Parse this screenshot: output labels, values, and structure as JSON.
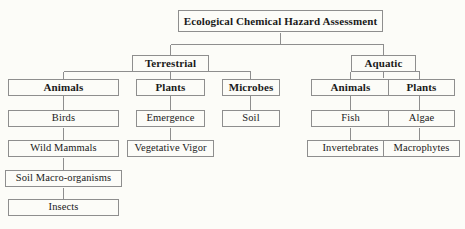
{
  "diagram": {
    "type": "hierarchy-tree",
    "title": "Ecological Chemical Hazard Assessment",
    "root": {
      "id": "root",
      "label": "Ecological Chemical Hazard Assessment",
      "level": 1
    },
    "branches": [
      {
        "id": "terrestrial",
        "label": "Terrestrial",
        "level": 2,
        "categories": [
          {
            "id": "terrestrial-animals",
            "label": "Animals",
            "level": 3,
            "leaves": [
              {
                "id": "birds",
                "label": "Birds"
              },
              {
                "id": "wild-mammals",
                "label": "Wild Mammals"
              },
              {
                "id": "soil-macro-organisms",
                "label": "Soil Macro-organisms"
              },
              {
                "id": "insects",
                "label": "Insects"
              }
            ]
          },
          {
            "id": "terrestrial-plants",
            "label": "Plants",
            "level": 3,
            "leaves": [
              {
                "id": "emergence",
                "label": "Emergence"
              },
              {
                "id": "vegetative-vigor",
                "label": "Vegetative Vigor"
              }
            ]
          },
          {
            "id": "terrestrial-microbes",
            "label": "Microbes",
            "level": 3,
            "leaves": [
              {
                "id": "soil",
                "label": "Soil"
              }
            ]
          }
        ]
      },
      {
        "id": "aquatic",
        "label": "Aquatic",
        "level": 2,
        "categories": [
          {
            "id": "aquatic-animals",
            "label": "Animals",
            "level": 3,
            "leaves": [
              {
                "id": "fish",
                "label": "Fish"
              },
              {
                "id": "invertebrates",
                "label": "Invertebrates"
              }
            ]
          },
          {
            "id": "aquatic-plants",
            "label": "Plants",
            "level": 3,
            "leaves": [
              {
                "id": "algae",
                "label": "Algae"
              },
              {
                "id": "macrophytes",
                "label": "Macrophytes"
              }
            ]
          }
        ]
      }
    ],
    "style": {
      "background_color": "#fcfcf8",
      "box_border_color": "#8e8e8e",
      "connector_color": "#8e8e8e",
      "text_color": "#1a1a1a"
    }
  }
}
